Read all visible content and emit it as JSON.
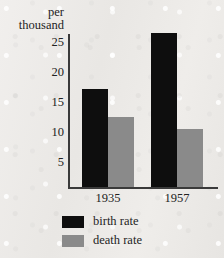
{
  "chart_data": {
    "type": "bar",
    "title": "",
    "ylabel_line1": "per",
    "ylabel_line2": "thousand",
    "ylabel": "per thousand",
    "xlabel": "",
    "categories": [
      "1935",
      "1957"
    ],
    "series": [
      {
        "name": "birth rate",
        "color": "#0e0e0e",
        "values": [
          16,
          26
        ]
      },
      {
        "name": "death rate",
        "color": "#8a8a8a",
        "values": [
          11.5,
          9.5
        ]
      }
    ],
    "yticks": [
      25,
      20,
      15,
      10,
      5
    ],
    "ytick_labels": [
      "25",
      "20",
      "15",
      "10",
      "5"
    ],
    "ylim": [
      0,
      28
    ],
    "grid": false,
    "legend_position": "bottom-center"
  },
  "axis": {
    "y_title_line1": "per",
    "y_title_line2": "thousand",
    "tick_25": "25",
    "tick_20": "20",
    "tick_15": "15",
    "tick_10": "10",
    "tick_5": "5"
  },
  "xlabels": {
    "group1": "1935",
    "group2": "1957"
  },
  "legend": {
    "birth_label": "birth rate",
    "death_label": "death rate"
  },
  "colors": {
    "birth": "#0e0e0e",
    "death": "#8a8a8a",
    "paper": "#eceae7",
    "ink": "#222222"
  }
}
